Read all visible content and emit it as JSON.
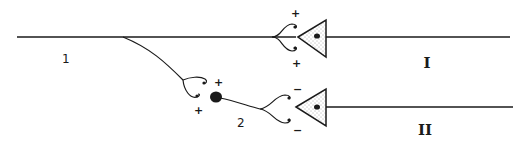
{
  "diagram": {
    "type": "neural-circuit",
    "colors": {
      "ink": "#1a1a1a",
      "background": "#ffffff"
    },
    "labels": {
      "fiber_1": "1",
      "interneuron_2": "2",
      "neuron_I": "I",
      "neuron_II": "II"
    },
    "synapses": {
      "fiber1_to_neuronI": {
        "signs": [
          "+",
          "+"
        ],
        "type": "excitatory"
      },
      "fiber1_to_interneuron2": {
        "signs": [
          "+",
          "+"
        ],
        "type": "excitatory"
      },
      "interneuron2_to_neuronII": {
        "signs": [
          "−",
          "−"
        ],
        "type": "inhibitory"
      }
    }
  }
}
